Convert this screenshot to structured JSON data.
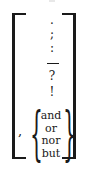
{
  "figure": {
    "punctuation_marks": [
      {
        "symbol": ".",
        "top": 14
      },
      {
        "symbol": ";",
        "top": 28
      },
      {
        "symbol": ":",
        "top": 42
      }
    ],
    "dash_symbol": "—",
    "more_marks": [
      {
        "symbol": "?",
        "top": 70
      },
      {
        "symbol": "!",
        "top": 86
      }
    ],
    "comma": ",",
    "brace_open": "{",
    "brace_close": "}",
    "conjunctions": [
      "and",
      "or",
      "nor",
      "but"
    ]
  },
  "colors": {
    "ink": "#1a1a1a",
    "background": "#ffffff"
  }
}
